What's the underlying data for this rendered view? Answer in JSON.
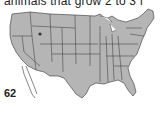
{
  "caption": "animals that grow 2 to 3 f",
  "map": {
    "subject": "United States map with state borders",
    "fill_color": "#b5b5b5",
    "border_color": "#333333"
  },
  "page_number": "62"
}
